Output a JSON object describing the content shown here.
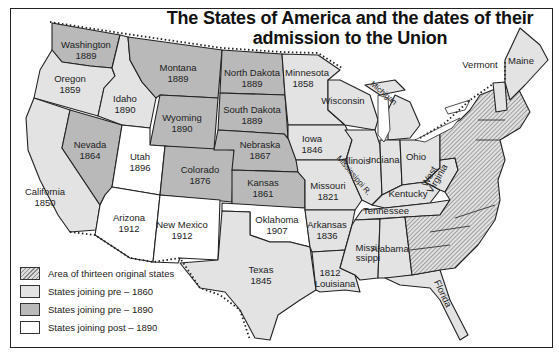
{
  "title": {
    "line1": "The States of America and the dates of their",
    "line2": "admission to the Union"
  },
  "colors": {
    "original": "#d4d4d4",
    "pre1860": "#e3e3e3",
    "pre1890": "#b9b9b9",
    "post1890": "#ffffff",
    "border": "#222222"
  },
  "states": [
    {
      "name": "Washington",
      "year": "1889",
      "category": "pre-1890"
    },
    {
      "name": "Oregon",
      "year": "1859",
      "category": "pre-1860"
    },
    {
      "name": "California",
      "year": "1850",
      "category": "pre-1860"
    },
    {
      "name": "Idaho",
      "year": "1890",
      "category": "pre-1890"
    },
    {
      "name": "Nevada",
      "year": "1864",
      "category": "pre-1890"
    },
    {
      "name": "Montana",
      "year": "1889",
      "category": "pre-1890"
    },
    {
      "name": "Wyoming",
      "year": "1890",
      "category": "pre-1890"
    },
    {
      "name": "Utah",
      "year": "1896",
      "category": "post-1890"
    },
    {
      "name": "Colorado",
      "year": "1876",
      "category": "pre-1890"
    },
    {
      "name": "Arizona",
      "year": "1912",
      "category": "post-1890"
    },
    {
      "name": "New Mexico",
      "year": "1912",
      "category": "post-1890"
    },
    {
      "name": "North Dakota",
      "year": "1889",
      "category": "pre-1890"
    },
    {
      "name": "South Dakota",
      "year": "1889",
      "category": "pre-1890"
    },
    {
      "name": "Nebraska",
      "year": "1867",
      "category": "pre-1890"
    },
    {
      "name": "Kansas",
      "year": "1861",
      "category": "pre-1890"
    },
    {
      "name": "Oklahoma",
      "year": "1907",
      "category": "post-1890"
    },
    {
      "name": "Texas",
      "year": "1845",
      "category": "pre-1860"
    },
    {
      "name": "Minnesota",
      "year": "1858",
      "category": "pre-1860"
    },
    {
      "name": "Iowa",
      "year": "1846",
      "category": "pre-1860"
    },
    {
      "name": "Missouri",
      "year": "1821",
      "category": "pre-1860"
    },
    {
      "name": "Arkansas",
      "year": "1836",
      "category": "pre-1860"
    },
    {
      "name": "Louisiana",
      "year": "1812",
      "category": "pre-1860"
    },
    {
      "name": "Wisconsin",
      "year": "",
      "category": "pre-1860"
    },
    {
      "name": "Illinois",
      "year": "",
      "category": "pre-1860"
    },
    {
      "name": "Michigan",
      "year": "",
      "category": "pre-1860"
    },
    {
      "name": "Indiana",
      "year": "",
      "category": "pre-1860"
    },
    {
      "name": "Ohio",
      "year": "",
      "category": "pre-1860"
    },
    {
      "name": "Kentucky",
      "year": "",
      "category": "pre-1860"
    },
    {
      "name": "Tennessee",
      "year": "",
      "category": "pre-1860"
    },
    {
      "name": "Mississippi",
      "year": "",
      "category": "pre-1860"
    },
    {
      "name": "Alabama",
      "year": "",
      "category": "pre-1860"
    },
    {
      "name": "Florida",
      "year": "",
      "category": "pre-1860"
    },
    {
      "name": "West Virginia",
      "year": "",
      "category": "pre-1890"
    },
    {
      "name": "Vermont",
      "year": "",
      "category": "pre-1860"
    },
    {
      "name": "Maine",
      "year": "",
      "category": "pre-1860"
    }
  ],
  "annotations": {
    "mississippi_river": "Mississippi R."
  },
  "labels": {
    "washington": "Washington",
    "washington_year": "1889",
    "oregon": "Oregon",
    "oregon_year": "1859",
    "california": "California",
    "california_year": "1850",
    "idaho": "Idaho",
    "idaho_year": "1890",
    "nevada": "Nevada",
    "nevada_year": "1864",
    "montana": "Montana",
    "montana_year": "1889",
    "wyoming": "Wyoming",
    "wyoming_year": "1890",
    "utah": "Utah",
    "utah_year": "1896",
    "colorado": "Colorado",
    "colorado_year": "1876",
    "arizona": "Arizona",
    "arizona_year": "1912",
    "newmexico": "New Mexico",
    "newmexico_year": "1912",
    "northdakota": "North Dakota",
    "northdakota_year": "1889",
    "southdakota": "South Dakota",
    "southdakota_year": "1889",
    "nebraska": "Nebraska",
    "nebraska_year": "1867",
    "kansas": "Kansas",
    "kansas_year": "1861",
    "oklahoma": "Oklahoma",
    "oklahoma_year": "1907",
    "texas": "Texas",
    "texas_year": "1845",
    "minnesota": "Minnesota",
    "minnesota_year": "1858",
    "iowa": "Iowa",
    "iowa_year": "1846",
    "missouri": "Missouri",
    "missouri_year": "1821",
    "arkansas": "Arkansas",
    "arkansas_year": "1836",
    "louisiana": "Louisiana",
    "louisiana_year": "1812",
    "wisconsin": "Wisconsin",
    "illinois": "Illinois",
    "michigan": "Michigan",
    "indiana": "Indiana",
    "ohio": "Ohio",
    "kentucky": "Kentucky",
    "tennessee": "Tennessee",
    "mississippi1": "Missi-",
    "mississippi2": "ssippi",
    "alabama": "Alabama",
    "florida": "Florida",
    "westvirginia1": "West",
    "westvirginia2": "Virginia",
    "vermont": "Vermont",
    "maine": "Maine"
  },
  "legend": {
    "items": [
      {
        "label": "Area of thirteen original states",
        "pattern": "hatched"
      },
      {
        "label": "States joining pre – 1860",
        "pattern": "light"
      },
      {
        "label": "States joining pre – 1890",
        "pattern": "medium"
      },
      {
        "label": "States joining post – 1890",
        "pattern": "white"
      }
    ]
  }
}
